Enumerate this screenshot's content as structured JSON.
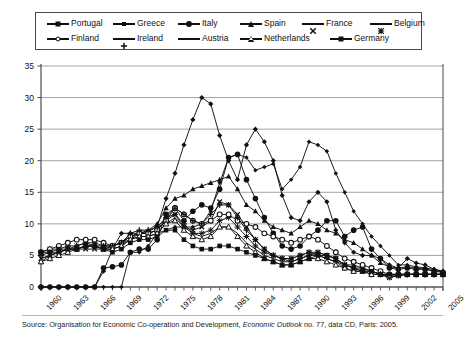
{
  "legend": {
    "rows": [
      [
        {
          "label": "Portugal",
          "marker": "filled-diamond"
        },
        {
          "label": "Greece",
          "marker": "filled-diamond-small"
        },
        {
          "label": "Italy",
          "marker": "filled-circle"
        },
        {
          "label": "Spain",
          "marker": "filled-triangle"
        },
        {
          "label": "France",
          "marker": "cross-x"
        },
        {
          "label": "Belgium",
          "marker": "asterisk"
        }
      ],
      [
        {
          "label": "Finland",
          "marker": "open-circle"
        },
        {
          "label": "Ireland",
          "marker": "plus"
        },
        {
          "label": "Austria",
          "marker": "line-only"
        },
        {
          "label": "Netherlands",
          "marker": "open-triangle"
        },
        {
          "label": "Germany",
          "marker": "filled-square"
        }
      ]
    ]
  },
  "source": {
    "prefix": "Source: Organisation for Economic Co-operation and Development, ",
    "italic": "Economic Outlook",
    "suffix": " no. 77, data CD, Paris: 2005."
  },
  "chart_data": {
    "type": "line",
    "title": "",
    "xlabel": "",
    "ylabel": "",
    "ylim": [
      0,
      35
    ],
    "yticks": [
      0,
      5,
      10,
      15,
      20,
      25,
      30,
      35
    ],
    "xlim": [
      1960,
      2005
    ],
    "xticks": [
      1960,
      1963,
      1966,
      1969,
      1972,
      1975,
      1978,
      1981,
      1984,
      1987,
      1990,
      1993,
      1996,
      1999,
      2002,
      2005
    ],
    "grid": "horizontal",
    "legend_position": "top",
    "x": [
      1960,
      1961,
      1962,
      1963,
      1964,
      1965,
      1966,
      1967,
      1968,
      1969,
      1970,
      1971,
      1972,
      1973,
      1974,
      1975,
      1976,
      1977,
      1978,
      1979,
      1980,
      1981,
      1982,
      1983,
      1984,
      1985,
      1986,
      1987,
      1988,
      1989,
      1990,
      1991,
      1992,
      1993,
      1994,
      1995,
      1996,
      1997,
      1998,
      1999,
      2000,
      2001,
      2002,
      2003,
      2004,
      2005
    ],
    "series": [
      {
        "name": "Portugal",
        "marker": "filled-diamond",
        "values": [
          0,
          0,
          0,
          0,
          0,
          0,
          0,
          2.5,
          6.0,
          8.5,
          8.5,
          8.5,
          8.8,
          9.5,
          14.0,
          18.0,
          22.5,
          26.5,
          30.0,
          29.0,
          24.0,
          20.0,
          17.0,
          22.5,
          25.0,
          23.0,
          20.0,
          14.5,
          11.0,
          10.5,
          13.5,
          15.0,
          13.5,
          9.0,
          7.0,
          5.5,
          5.0,
          5.0,
          4.5,
          3.5,
          3.0,
          4.5,
          3.8,
          3.5,
          2.8,
          2.5
        ]
      },
      {
        "name": "Greece",
        "marker": "filled-diamond-small",
        "values": [
          0,
          0,
          0,
          0,
          0,
          0,
          0,
          0,
          0,
          0,
          5.5,
          5.5,
          6.5,
          8.5,
          9.0,
          9.5,
          9.5,
          9.5,
          10.0,
          12.0,
          16.5,
          20.5,
          21.0,
          20.5,
          18.5,
          19.0,
          19.5,
          15.5,
          17.0,
          19.0,
          23.0,
          22.5,
          21.5,
          18.0,
          15.0,
          12.0,
          10.0,
          8.0,
          6.5,
          5.0,
          3.5,
          3.5,
          3.2,
          3.0,
          2.8,
          2.5
        ]
      },
      {
        "name": "Italy",
        "marker": "filled-circle",
        "values": [
          0,
          0,
          0,
          0,
          0,
          0,
          0,
          3.0,
          3.2,
          3.5,
          5.5,
          6.0,
          6.0,
          7.5,
          11.5,
          12.5,
          10.5,
          12.0,
          13.0,
          12.5,
          15.5,
          20.5,
          21.0,
          17.0,
          14.0,
          11.0,
          8.5,
          6.5,
          6.0,
          6.5,
          8.0,
          9.0,
          10.5,
          10.5,
          8.0,
          9.0,
          9.5,
          6.0,
          4.5,
          3.0,
          2.8,
          3.0,
          2.8,
          2.8,
          2.5,
          2.3
        ]
      },
      {
        "name": "Spain",
        "marker": "filled-triangle",
        "values": [
          4.0,
          5.0,
          5.5,
          6.0,
          6.5,
          7.0,
          6.5,
          6.0,
          6.5,
          7.0,
          7.5,
          8.5,
          9.0,
          10.0,
          12.5,
          14.0,
          14.5,
          15.5,
          16.0,
          16.5,
          17.0,
          17.5,
          15.5,
          13.0,
          12.0,
          10.5,
          9.5,
          9.0,
          8.5,
          9.5,
          10.5,
          10.0,
          9.0,
          8.5,
          7.5,
          7.0,
          6.0,
          5.0,
          3.8,
          3.2,
          3.0,
          3.2,
          3.0,
          2.8,
          2.6,
          2.4
        ]
      },
      {
        "name": "France",
        "marker": "cross-x",
        "values": [
          4.5,
          5.0,
          5.5,
          6.0,
          6.0,
          6.0,
          6.0,
          6.0,
          6.5,
          7.0,
          8.0,
          8.5,
          8.5,
          9.0,
          10.5,
          11.5,
          9.5,
          9.0,
          9.5,
          10.5,
          13.5,
          13.0,
          11.5,
          9.5,
          7.5,
          6.0,
          5.0,
          4.5,
          4.5,
          5.0,
          5.5,
          5.5,
          5.0,
          4.5,
          3.5,
          3.5,
          3.0,
          2.5,
          2.0,
          1.5,
          1.8,
          2.0,
          2.0,
          2.0,
          2.0,
          2.0
        ]
      },
      {
        "name": "Belgium",
        "marker": "asterisk",
        "values": [
          5.5,
          6.0,
          6.0,
          6.5,
          6.5,
          7.0,
          7.0,
          6.5,
          6.5,
          7.0,
          8.0,
          8.5,
          8.5,
          9.0,
          11.0,
          11.5,
          10.0,
          8.5,
          8.5,
          9.0,
          10.5,
          11.0,
          9.5,
          8.0,
          6.5,
          5.5,
          5.0,
          4.5,
          4.0,
          4.5,
          5.0,
          5.5,
          5.0,
          4.5,
          3.5,
          3.0,
          3.0,
          2.5,
          2.0,
          1.5,
          1.8,
          2.0,
          2.0,
          2.0,
          2.0,
          2.0
        ]
      },
      {
        "name": "Finland",
        "marker": "open-circle",
        "values": [
          5.5,
          6.0,
          6.5,
          7.0,
          7.5,
          7.5,
          7.5,
          7.0,
          6.5,
          7.0,
          8.0,
          8.5,
          8.5,
          9.0,
          10.5,
          12.5,
          11.5,
          10.5,
          10.0,
          10.5,
          11.5,
          11.5,
          10.5,
          10.0,
          9.5,
          8.5,
          8.0,
          7.5,
          7.0,
          7.5,
          8.0,
          7.5,
          6.5,
          5.5,
          4.5,
          4.0,
          3.5,
          3.0,
          2.5,
          2.0,
          2.0,
          2.0,
          2.0,
          2.0,
          2.0,
          2.0
        ]
      },
      {
        "name": "Ireland",
        "marker": "plus",
        "values": [
          5.0,
          5.5,
          5.5,
          6.0,
          6.0,
          6.5,
          6.5,
          6.5,
          6.5,
          7.0,
          8.5,
          9.0,
          9.0,
          9.5,
          11.0,
          12.5,
          11.5,
          10.5,
          10.0,
          11.5,
          13.0,
          13.0,
          11.0,
          9.0,
          7.5,
          6.0,
          5.0,
          4.5,
          4.5,
          5.0,
          5.5,
          5.0,
          4.5,
          4.0,
          3.0,
          2.5,
          2.5,
          2.0,
          2.0,
          2.0,
          2.0,
          2.0,
          2.0,
          2.0,
          2.0,
          2.0
        ]
      },
      {
        "name": "Austria",
        "marker": "line-only",
        "values": [
          4.5,
          5.0,
          5.5,
          6.0,
          6.0,
          6.5,
          6.5,
          6.0,
          6.0,
          6.5,
          7.5,
          8.0,
          8.0,
          8.5,
          10.0,
          11.0,
          9.5,
          8.5,
          8.0,
          8.5,
          9.5,
          9.5,
          8.5,
          7.0,
          6.0,
          5.0,
          4.5,
          4.0,
          4.0,
          4.5,
          5.0,
          5.0,
          4.5,
          4.0,
          3.5,
          3.0,
          2.5,
          2.5,
          2.0,
          1.8,
          2.0,
          2.0,
          2.0,
          2.0,
          2.0,
          2.0
        ]
      },
      {
        "name": "Netherlands",
        "marker": "open-triangle",
        "values": [
          4.0,
          4.5,
          5.0,
          5.5,
          6.0,
          6.5,
          6.5,
          6.0,
          6.0,
          6.5,
          7.5,
          8.0,
          8.0,
          8.5,
          10.0,
          10.5,
          9.0,
          8.0,
          7.5,
          8.0,
          9.5,
          9.5,
          8.0,
          6.5,
          5.5,
          4.5,
          4.0,
          3.5,
          3.5,
          4.0,
          4.5,
          4.5,
          4.0,
          3.5,
          3.0,
          2.5,
          2.5,
          2.0,
          2.0,
          1.8,
          2.0,
          2.0,
          2.0,
          2.0,
          2.0,
          2.0
        ]
      },
      {
        "name": "Germany",
        "marker": "filled-square",
        "values": [
          5.5,
          5.5,
          6.0,
          6.0,
          6.0,
          6.5,
          6.5,
          6.0,
          5.5,
          6.0,
          7.0,
          7.5,
          7.5,
          8.0,
          9.0,
          9.0,
          7.5,
          6.5,
          6.0,
          6.0,
          6.5,
          6.5,
          6.0,
          5.5,
          5.0,
          4.5,
          4.0,
          3.5,
          3.5,
          4.0,
          4.5,
          5.0,
          5.0,
          4.5,
          3.5,
          3.0,
          2.5,
          2.5,
          2.0,
          2.0,
          2.0,
          2.0,
          2.0,
          2.0,
          2.0,
          2.0
        ]
      }
    ]
  }
}
